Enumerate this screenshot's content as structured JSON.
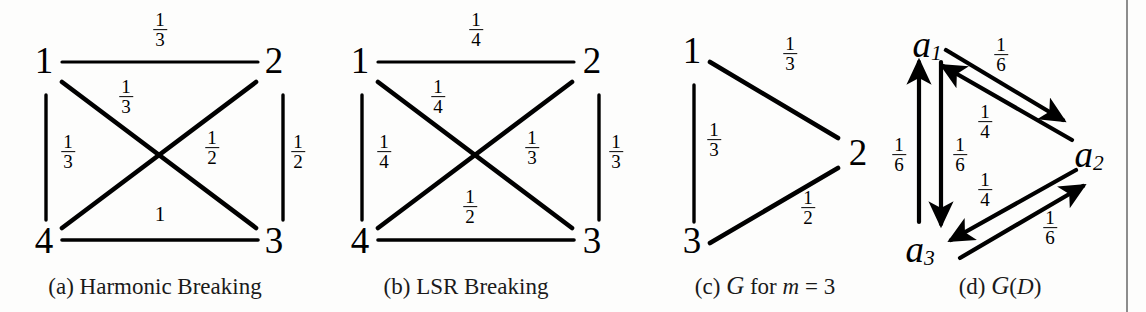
{
  "figure": {
    "width": 1146,
    "height": 312,
    "background": "#fdfdfc",
    "stroke_color": "#000000",
    "divider_color": "#8d8d8d"
  },
  "panels": [
    {
      "id": "a",
      "caption": "(a) Harmonic Breaking",
      "type": "undirected-graph",
      "nodes": [
        {
          "name": "1",
          "label": "1",
          "x": 44,
          "y": 60
        },
        {
          "name": "2",
          "label": "2",
          "x": 274,
          "y": 60
        },
        {
          "name": "4",
          "label": "4",
          "x": 44,
          "y": 240
        },
        {
          "name": "3",
          "label": "3",
          "x": 274,
          "y": 240
        }
      ],
      "edges": [
        {
          "name": "edge-1-2",
          "from": "1",
          "to": "2",
          "weight_num": "1",
          "weight_den": "3",
          "label_x": 160,
          "label_y": 30
        },
        {
          "name": "edge-1-3",
          "from": "1",
          "to": "3",
          "weight_num": "1",
          "weight_den": "3",
          "label_x": 126,
          "label_y": 97
        },
        {
          "name": "edge-2-4",
          "from": "2",
          "to": "4",
          "weight_num": "1",
          "weight_den": "2",
          "label_x": 212,
          "label_y": 148
        },
        {
          "name": "edge-1-4",
          "from": "1",
          "to": "4",
          "weight_num": "1",
          "weight_den": "3",
          "label_x": 68,
          "label_y": 152
        },
        {
          "name": "edge-2-3",
          "from": "2",
          "to": "3",
          "weight_num": "1",
          "weight_den": "2",
          "label_x": 298,
          "label_y": 152
        },
        {
          "name": "edge-4-3",
          "from": "4",
          "to": "3",
          "weight_num": "1",
          "weight_den": "",
          "label_x": 160,
          "label_y": 215
        }
      ]
    },
    {
      "id": "b",
      "caption": "(b) LSR Breaking",
      "type": "undirected-graph",
      "nodes": [
        {
          "name": "1",
          "label": "1",
          "x": 360,
          "y": 60
        },
        {
          "name": "2",
          "label": "2",
          "x": 592,
          "y": 60
        },
        {
          "name": "4",
          "label": "4",
          "x": 360,
          "y": 240
        },
        {
          "name": "3",
          "label": "3",
          "x": 592,
          "y": 240
        }
      ],
      "edges": [
        {
          "name": "edge-1-2",
          "from": "1",
          "to": "2",
          "weight_num": "1",
          "weight_den": "4",
          "label_x": 476,
          "label_y": 30
        },
        {
          "name": "edge-1-3",
          "from": "1",
          "to": "3",
          "weight_num": "1",
          "weight_den": "4",
          "label_x": 438,
          "label_y": 97
        },
        {
          "name": "edge-2-4",
          "from": "2",
          "to": "4",
          "weight_num": "1",
          "weight_den": "3",
          "label_x": 532,
          "label_y": 148
        },
        {
          "name": "edge-1-4",
          "from": "1",
          "to": "4",
          "weight_num": "1",
          "weight_den": "4",
          "label_x": 384,
          "label_y": 152
        },
        {
          "name": "edge-2-3",
          "from": "2",
          "to": "3",
          "weight_num": "1",
          "weight_den": "3",
          "label_x": 616,
          "label_y": 152
        },
        {
          "name": "edge-4-3",
          "from": "4",
          "to": "3",
          "weight_num": "1",
          "weight_den": "2",
          "label_x": 470,
          "label_y": 207
        }
      ]
    },
    {
      "id": "c",
      "caption_parts": {
        "prefix": "(c) ",
        "cal": "G",
        "mid": " for ",
        "italic": "m",
        "suffix": " = 3"
      },
      "caption": "(c) G for m = 3",
      "type": "undirected-graph",
      "nodes": [
        {
          "name": "1",
          "label": "1",
          "x": 692,
          "y": 50
        },
        {
          "name": "2",
          "label": "2",
          "x": 858,
          "y": 152
        },
        {
          "name": "3",
          "label": "3",
          "x": 692,
          "y": 240
        }
      ],
      "edges": [
        {
          "name": "edge-1-2",
          "from": "1",
          "to": "2",
          "weight_num": "1",
          "weight_den": "3",
          "label_x": 790,
          "label_y": 54
        },
        {
          "name": "edge-1-3",
          "from": "1",
          "to": "3",
          "weight_num": "1",
          "weight_den": "3",
          "label_x": 712,
          "label_y": 140
        },
        {
          "name": "edge-3-2",
          "from": "3",
          "to": "2",
          "weight_num": "1",
          "weight_den": "2",
          "label_x": 808,
          "label_y": 208
        }
      ]
    },
    {
      "id": "d",
      "caption_parts": {
        "prefix": "(d) ",
        "cal": "G",
        "mid": "(",
        "italic": "D",
        "suffix": ")"
      },
      "caption": "(d) G(D)",
      "type": "directed-graph",
      "nodes": [
        {
          "name": "a1",
          "label": "a",
          "sub": "1",
          "x": 927,
          "y": 45
        },
        {
          "name": "a2",
          "label": "a",
          "sub": "2",
          "x": 1089,
          "y": 155
        },
        {
          "name": "a3",
          "label": "a",
          "sub": "3",
          "x": 920,
          "y": 250
        }
      ],
      "edges": [
        {
          "name": "edge-a1-a2",
          "from": "a1",
          "to": "a2",
          "weight_num": "1",
          "weight_den": "6",
          "label_x": 1001,
          "label_y": 55
        },
        {
          "name": "edge-a2-a1",
          "from": "a2",
          "to": "a1",
          "weight_num": "1",
          "weight_den": "4",
          "label_x": 985,
          "label_y": 122
        },
        {
          "name": "edge-a3-a1",
          "from": "a3",
          "to": "a1",
          "weight_num": "1",
          "weight_den": "6",
          "label_x": 899,
          "label_y": 155
        },
        {
          "name": "edge-a1-a3",
          "from": "a1",
          "to": "a3",
          "weight_num": "1",
          "weight_den": "6",
          "label_x": 952,
          "label_y": 155
        },
        {
          "name": "edge-a2-a3",
          "from": "a2",
          "to": "a3",
          "weight_num": "1",
          "weight_den": "4",
          "label_x": 985,
          "label_y": 190
        },
        {
          "name": "edge-a3-a2",
          "from": "a3",
          "to": "a2",
          "weight_num": "1",
          "weight_den": "6",
          "label_x": 1050,
          "label_y": 228
        }
      ]
    }
  ]
}
